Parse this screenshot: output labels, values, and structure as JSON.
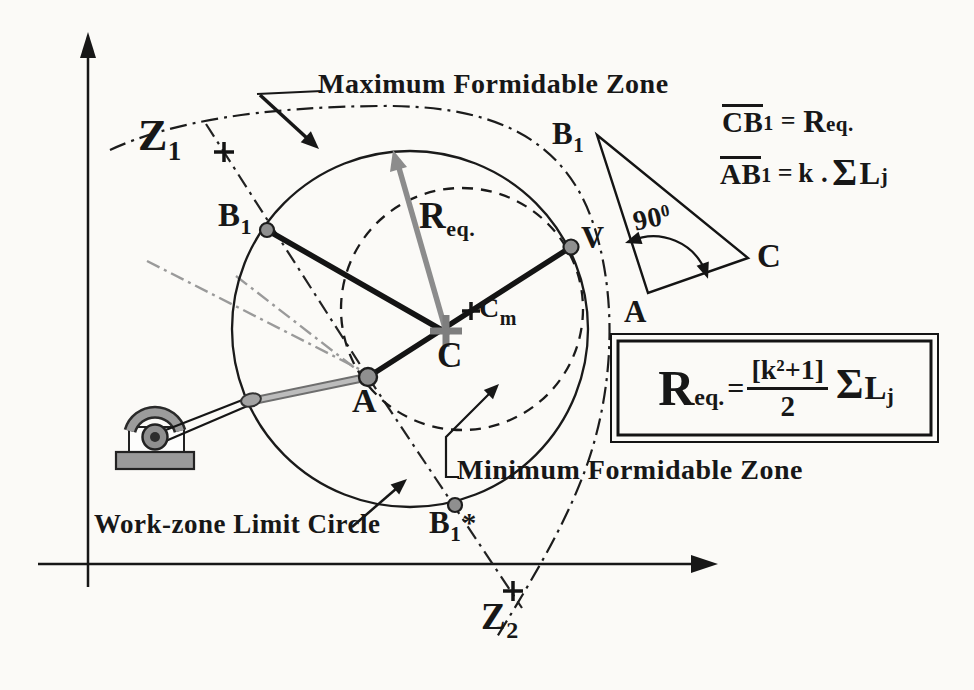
{
  "zones": {
    "max": "Maximum Formidable Zone",
    "min": "Minimum Formidable Zone",
    "work": "Work-zone Limit Circle"
  },
  "points": {
    "z1": {
      "main": "Z",
      "sub": "1"
    },
    "z2": {
      "main": "Z",
      "sub": "2"
    },
    "b1": {
      "main": "B",
      "sub": "1"
    },
    "b1_star": {
      "main": "B",
      "sub": "1",
      "star": "*"
    },
    "a": "A",
    "c": "C",
    "cm": {
      "main": "C",
      "sub": "m"
    },
    "v": "V",
    "req": {
      "main": "R",
      "sub": "eq."
    }
  },
  "triangle": {
    "b1": {
      "main": "B",
      "sub": "1"
    },
    "a": "A",
    "c": "C",
    "angle": {
      "main": "90",
      "sup": "0"
    }
  },
  "equations": {
    "line1": {
      "bar": "CB",
      "bar_sub": "1",
      "eq": "=",
      "rhs": "R",
      "rhs_sub": "eq."
    },
    "line2": {
      "bar": "AB",
      "bar_sub": "1",
      "eq": "=",
      "k": "k .",
      "sigma": "Σ",
      "l": "L",
      "l_sub": "j"
    }
  },
  "formula": {
    "lhs": "R",
    "lhs_sub": "eq.",
    "eq": "=",
    "num": "[k²+1]",
    "den": "2",
    "sigma": "Σ",
    "l": "L",
    "l_sub": "j"
  },
  "colors": {
    "ink": "#171717",
    "gray": "#8c8c8c",
    "paper": "#fbfaf7"
  }
}
